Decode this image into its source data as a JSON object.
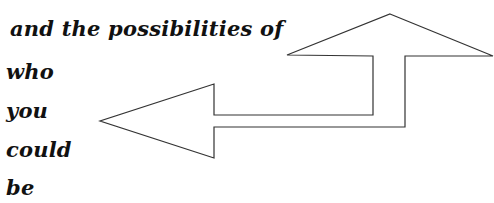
{
  "text_lines": [
    "and the possibilities of",
    "who",
    "you",
    "could",
    "be"
  ],
  "arrows": {
    "stroke_color": "#333333",
    "fill_color": "#ffffff",
    "description": "Bent arrow: one head points up (top-right), other head points left"
  }
}
